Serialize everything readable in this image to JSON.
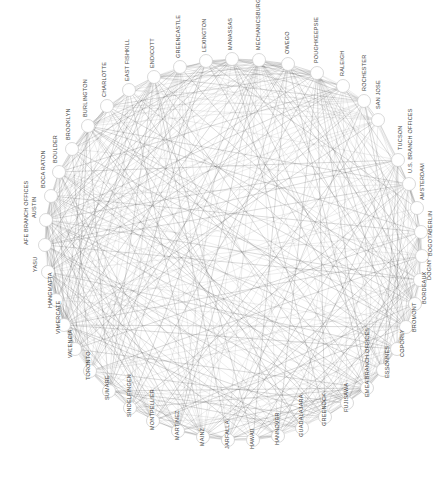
{
  "diagram": {
    "type": "circular-network-graph",
    "node_count": 44,
    "colors": {
      "background": "#ffffff",
      "edge": "#1a1a1a",
      "node_fill": "#ffffff",
      "node_stroke": "#cfcfcf",
      "label": "#444444"
    },
    "nodes": [
      {
        "id": "MECHANICSBURG",
        "x": 259,
        "y": 60
      },
      {
        "id": "OWEGO",
        "x": 288,
        "y": 64
      },
      {
        "id": "POUGHKEEPSIE",
        "x": 317,
        "y": 73
      },
      {
        "id": "RALEIGH",
        "x": 343,
        "y": 86
      },
      {
        "id": "ROCHESTER",
        "x": 364,
        "y": 101
      },
      {
        "id": "SAN JOSE",
        "x": 378,
        "y": 120
      },
      {
        "id": "TUCSON",
        "x": 398,
        "y": 160
      },
      {
        "id": "U.S. BRANCH OFFICES",
        "x": 409,
        "y": 184
      },
      {
        "id": "AMSTERDAM",
        "x": 417,
        "y": 208
      },
      {
        "id": "BERLIN",
        "x": 421,
        "y": 232
      },
      {
        "id": "BOGOTA",
        "x": 422,
        "y": 256
      },
      {
        "id": "DOGNY",
        "x": 420,
        "y": 280
      },
      {
        "id": "BORDEAUX",
        "x": 415,
        "y": 304
      },
      {
        "id": "BROMONT",
        "x": 406,
        "y": 327
      },
      {
        "id": "COPORLY",
        "x": 397,
        "y": 349
      },
      {
        "id": "ESSONNES",
        "x": 383,
        "y": 370
      },
      {
        "id": "EMEA BRANCH OFFICES",
        "x": 367,
        "y": 388
      },
      {
        "id": "FUJISAWA",
        "x": 347,
        "y": 403
      },
      {
        "id": "GREENOCK",
        "x": 325,
        "y": 417
      },
      {
        "id": "GUADALAJARA",
        "x": 302,
        "y": 428
      },
      {
        "id": "HANNOVER",
        "x": 278,
        "y": 436
      },
      {
        "id": "HAWAII",
        "x": 253,
        "y": 440
      },
      {
        "id": "JARFALLA",
        "x": 228,
        "y": 440
      },
      {
        "id": "MAINZ",
        "x": 203,
        "y": 437
      },
      {
        "id": "MARTINEZ",
        "x": 178,
        "y": 431
      },
      {
        "id": "MONTPELLIER",
        "x": 153,
        "y": 421
      },
      {
        "id": "SINDELFINGEN",
        "x": 130,
        "y": 408
      },
      {
        "id": "SUMARE",
        "x": 109,
        "y": 391
      },
      {
        "id": "TORONTO",
        "x": 90,
        "y": 371
      },
      {
        "id": "VALENCIA",
        "x": 75,
        "y": 349
      },
      {
        "id": "VIMERCATE",
        "x": 64,
        "y": 325
      },
      {
        "id": "HANGMATTA",
        "x": 56,
        "y": 300
      },
      {
        "id": "YASU",
        "x": 48,
        "y": 272
      },
      {
        "id": "AFE BRANCH OFFICES",
        "x": 45,
        "y": 245
      },
      {
        "id": "AUSTIN",
        "x": 46,
        "y": 220
      },
      {
        "id": "BOCA RATON",
        "x": 51,
        "y": 196
      },
      {
        "id": "BOULDER",
        "x": 59,
        "y": 172
      },
      {
        "id": "BROOKLYN",
        "x": 72,
        "y": 149
      },
      {
        "id": "BURLINGTON",
        "x": 88,
        "y": 126
      },
      {
        "id": "CHARLOTTE",
        "x": 107,
        "y": 106
      },
      {
        "id": "EAST FISHKILL",
        "x": 129,
        "y": 90
      },
      {
        "id": "ENDICOTT",
        "x": 154,
        "y": 77
      },
      {
        "id": "GREENCASTLE",
        "x": 180,
        "y": 67
      },
      {
        "id": "LEXINGTON",
        "x": 206,
        "y": 61
      },
      {
        "id": "MANASSAS",
        "x": 232,
        "y": 59
      }
    ],
    "labels": [
      {
        "text": "MECHANICSBURG",
        "x": 260,
        "y": 50
      },
      {
        "text": "OWEGO",
        "x": 289,
        "y": 54
      },
      {
        "text": "POUGHKEEPSIE",
        "x": 318,
        "y": 63
      },
      {
        "text": "RALEIGH",
        "x": 344,
        "y": 76
      },
      {
        "text": "ROCHESTER",
        "x": 366,
        "y": 91
      },
      {
        "text": "SAN JOSE",
        "x": 380,
        "y": 109
      },
      {
        "text": "TUCSON",
        "x": 402,
        "y": 150
      },
      {
        "text": "U.S. BRANCH OFFICES",
        "x": 412,
        "y": 173
      },
      {
        "text": "AMSTERDAM",
        "x": 424,
        "y": 200
      },
      {
        "text": "BERLIN",
        "x": 432,
        "y": 232
      },
      {
        "text": "BOGOTA",
        "x": 432,
        "y": 256
      },
      {
        "text": "DOGNY",
        "x": 431,
        "y": 280
      },
      {
        "text": "BORDEAUX",
        "x": 426,
        "y": 304
      },
      {
        "text": "BROMONT",
        "x": 416,
        "y": 332
      },
      {
        "text": "COPORLY",
        "x": 404,
        "y": 357
      },
      {
        "text": "ESSONNES",
        "x": 389,
        "y": 378
      },
      {
        "text": "EMEA BRANCH OFFICES",
        "x": 369,
        "y": 397
      },
      {
        "text": "FUJISAWA",
        "x": 348,
        "y": 412
      },
      {
        "text": "GREENOCK",
        "x": 326,
        "y": 426
      },
      {
        "text": "GUADALAJARA",
        "x": 303,
        "y": 437
      },
      {
        "text": "HANNOVER",
        "x": 279,
        "y": 445
      },
      {
        "text": "HAWAII",
        "x": 254,
        "y": 449
      },
      {
        "text": "JARFALLA",
        "x": 229,
        "y": 449
      },
      {
        "text": "MAINZ",
        "x": 204,
        "y": 446
      },
      {
        "text": "MARTINEZ",
        "x": 179,
        "y": 440
      },
      {
        "text": "MONTPELLIER",
        "x": 154,
        "y": 430
      },
      {
        "text": "SINDELFINGEN",
        "x": 131,
        "y": 417
      },
      {
        "text": "SUMARE",
        "x": 109,
        "y": 400
      },
      {
        "text": "TORONTO",
        "x": 90,
        "y": 380
      },
      {
        "text": "VALENCIA",
        "x": 72,
        "y": 358
      },
      {
        "text": "VIMERCATE",
        "x": 60,
        "y": 334
      },
      {
        "text": "HANGMATTA",
        "x": 52,
        "y": 308
      },
      {
        "text": "YASU",
        "x": 37,
        "y": 272
      },
      {
        "text": "AFE BRANCH OFFICES",
        "x": 28,
        "y": 245
      },
      {
        "text": "AUSTIN",
        "x": 36,
        "y": 218
      },
      {
        "text": "BOCA RATON",
        "x": 45,
        "y": 188
      },
      {
        "text": "BOULDER",
        "x": 57,
        "y": 163
      },
      {
        "text": "BROOKLYN",
        "x": 70,
        "y": 140
      },
      {
        "text": "BURLINGTON",
        "x": 87,
        "y": 117
      },
      {
        "text": "CHARLOTTE",
        "x": 106,
        "y": 97
      },
      {
        "text": "EAST FISHKILL",
        "x": 129,
        "y": 81
      },
      {
        "text": "ENDICOTT",
        "x": 154,
        "y": 68
      },
      {
        "text": "GREENCASTLE",
        "x": 180,
        "y": 58
      },
      {
        "text": "LEXINGTON",
        "x": 206,
        "y": 52
      },
      {
        "text": "MANASSAS",
        "x": 232,
        "y": 50
      }
    ]
  }
}
